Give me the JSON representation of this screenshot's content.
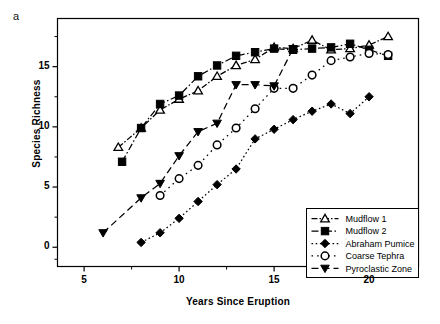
{
  "panel": {
    "label": "a"
  },
  "chart_data": {
    "type": "line",
    "title": "",
    "xlabel": "Years Since Eruption",
    "ylabel": "Species Richness",
    "xlim": [
      3.6,
      22.6
    ],
    "ylim": [
      -1.6,
      19.0
    ],
    "xticks": [
      5,
      10,
      15,
      20
    ],
    "yticks": [
      0,
      5,
      10,
      15
    ],
    "xtick_labels": [
      "5",
      "10",
      "15",
      "20"
    ],
    "ytick_labels": [
      "0",
      "5",
      "10",
      "15"
    ],
    "grid": false,
    "legend_position": "bottom-right",
    "series": [
      {
        "name": "Mudflow 1",
        "marker": "triangle-up-open",
        "linestyle": "dash-dot-dotted",
        "color": "#000000",
        "points": [
          [
            6.8,
            8.3
          ],
          [
            8.0,
            9.9
          ],
          [
            9.0,
            11.4
          ],
          [
            10.0,
            12.3
          ],
          [
            11.0,
            13.0
          ],
          [
            12.0,
            14.2
          ],
          [
            13.0,
            15.1
          ],
          [
            14.0,
            15.6
          ],
          [
            15.0,
            16.6
          ],
          [
            16.0,
            16.5
          ],
          [
            17.0,
            17.2
          ],
          [
            18.0,
            16.4
          ],
          [
            19.0,
            16.5
          ],
          [
            20.0,
            16.8
          ],
          [
            21.0,
            17.5
          ]
        ]
      },
      {
        "name": "Mudflow 2",
        "marker": "square-filled",
        "linestyle": "dash-dot",
        "color": "#000000",
        "points": [
          [
            7.0,
            7.1
          ],
          [
            8.0,
            9.9
          ],
          [
            9.0,
            11.9
          ],
          [
            10.0,
            12.6
          ],
          [
            11.0,
            14.2
          ],
          [
            12.0,
            15.1
          ],
          [
            13.0,
            15.9
          ],
          [
            14.0,
            16.2
          ],
          [
            15.0,
            16.5
          ],
          [
            16.0,
            16.4
          ],
          [
            17.0,
            16.5
          ],
          [
            18.0,
            16.6
          ],
          [
            19.0,
            16.9
          ],
          [
            20.0,
            16.4
          ],
          [
            21.0,
            15.9
          ]
        ]
      },
      {
        "name": "Abraham Pumice",
        "marker": "diamond-filled",
        "linestyle": "dotted",
        "color": "#000000",
        "points": [
          [
            8.0,
            0.4
          ],
          [
            9.0,
            1.2
          ],
          [
            10.0,
            2.4
          ],
          [
            11.0,
            3.8
          ],
          [
            12.0,
            5.2
          ],
          [
            13.0,
            6.5
          ],
          [
            14.0,
            9.0
          ],
          [
            15.0,
            9.8
          ],
          [
            16.0,
            10.6
          ],
          [
            17.0,
            11.3
          ],
          [
            18.0,
            11.9
          ],
          [
            19.0,
            11.1
          ],
          [
            20.0,
            12.5
          ]
        ]
      },
      {
        "name": "Coarse Tephra",
        "marker": "circle-open",
        "linestyle": "dotted-spaced",
        "color": "#000000",
        "points": [
          [
            9.0,
            4.3
          ],
          [
            10.0,
            5.7
          ],
          [
            11.0,
            6.8
          ],
          [
            12.0,
            8.5
          ],
          [
            13.0,
            9.9
          ],
          [
            14.0,
            11.5
          ],
          [
            15.0,
            13.2
          ],
          [
            16.0,
            13.2
          ],
          [
            17.0,
            14.3
          ],
          [
            18.0,
            15.5
          ],
          [
            19.0,
            15.8
          ],
          [
            20.0,
            16.1
          ],
          [
            21.0,
            16.0
          ]
        ]
      },
      {
        "name": "Pyroclastic Zone",
        "marker": "triangle-down-filled",
        "linestyle": "dashed",
        "color": "#000000",
        "points": [
          [
            6.0,
            1.2
          ],
          [
            8.0,
            4.1
          ],
          [
            9.0,
            5.3
          ],
          [
            10.0,
            7.6
          ],
          [
            11.0,
            9.6
          ],
          [
            12.0,
            10.3
          ],
          [
            13.0,
            13.5
          ],
          [
            14.0,
            13.5
          ],
          [
            15.0,
            13.4
          ],
          [
            16.0,
            16.5
          ]
        ]
      }
    ]
  }
}
